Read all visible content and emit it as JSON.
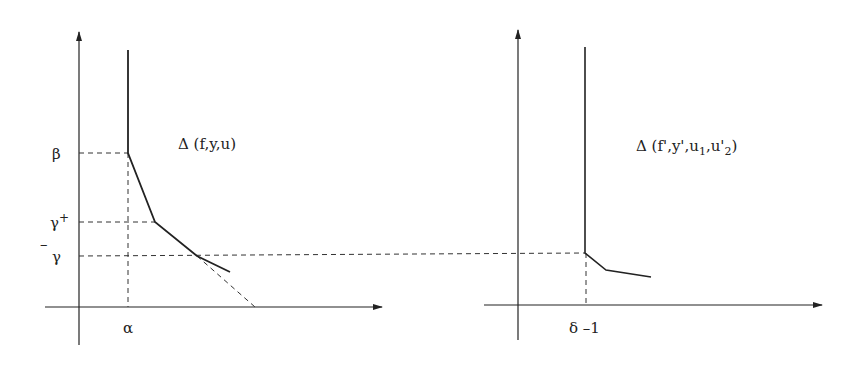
{
  "left_diagram": {
    "title": "Δ (f,y,u)",
    "y_labels": {
      "beta": "β",
      "gamma_plus_base": "γ",
      "gamma_plus_sup": "+",
      "gamma_bar_base": "γ",
      "gamma_bar_mark": "–"
    },
    "x_labels": {
      "alpha": "α"
    },
    "polygon_vertices": [
      [
        128,
        50
      ],
      [
        128,
        153
      ],
      [
        155,
        222
      ],
      [
        197,
        256
      ],
      [
        230,
        272
      ]
    ],
    "dashed_extension": [
      [
        197,
        256
      ],
      [
        255,
        307
      ]
    ]
  },
  "right_diagram": {
    "title_prefix": "Δ (f',y',u",
    "title_sub1": "1",
    "title_mid": ",u'",
    "title_sub2": "2",
    "title_suffix": ")",
    "x_labels": {
      "delta_minus_one": "δ –1"
    },
    "polygon_vertices": [
      [
        585,
        47
      ],
      [
        585,
        253
      ],
      [
        606,
        270
      ],
      [
        651,
        277
      ]
    ]
  },
  "colors": {
    "line": "#222222",
    "dash": "#333333",
    "background": "#ffffff"
  }
}
